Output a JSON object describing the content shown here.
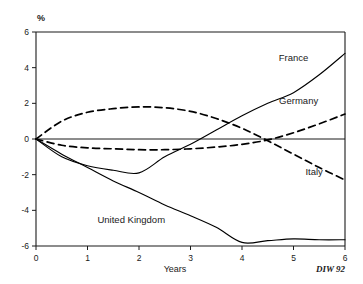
{
  "chart_data": {
    "type": "line",
    "title": "",
    "subtitle": "",
    "xlabel": "Years",
    "ylabel": "%",
    "unit_label": "%",
    "xlim": [
      0,
      6
    ],
    "ylim": [
      -6,
      6
    ],
    "grid": false,
    "legend_position": "inline-labels",
    "x_ticks": [
      "0",
      "1",
      "2",
      "3",
      "4",
      "5",
      "6"
    ],
    "y_ticks": [
      "6",
      "4",
      "2",
      "0",
      "-2",
      "-4",
      "-6"
    ],
    "x": [
      0,
      0.5,
      1,
      1.5,
      2,
      2.5,
      3,
      3.5,
      4,
      4.5,
      5,
      5.5,
      6
    ],
    "series": [
      {
        "name": "France",
        "style": "solid",
        "label": "France",
        "values": [
          0,
          -1.0,
          -1.5,
          -1.75,
          -1.9,
          -1.0,
          -0.3,
          0.5,
          1.3,
          2.0,
          2.6,
          3.6,
          4.8
        ]
      },
      {
        "name": "Germany",
        "style": "dashed",
        "label": "Germany",
        "values": [
          0,
          -0.35,
          -0.5,
          -0.55,
          -0.6,
          -0.6,
          -0.55,
          -0.45,
          -0.3,
          -0.05,
          0.35,
          0.85,
          1.4
        ]
      },
      {
        "name": "Italy",
        "style": "dashed",
        "label": "Italy",
        "values": [
          0,
          1.0,
          1.5,
          1.7,
          1.8,
          1.75,
          1.55,
          1.15,
          0.6,
          -0.1,
          -0.85,
          -1.6,
          -2.3
        ]
      },
      {
        "name": "United Kingdom",
        "style": "solid",
        "label": "United Kingdom",
        "values": [
          0,
          -0.85,
          -1.6,
          -2.35,
          -3.0,
          -3.7,
          -4.3,
          -4.95,
          -5.8,
          -5.7,
          -5.6,
          -5.65,
          -5.65
        ]
      }
    ],
    "annotations": [
      {
        "text": "France",
        "x": 5.0,
        "y": 4.35
      },
      {
        "text": "Germany",
        "x": 5.1,
        "y": 1.95
      },
      {
        "text": "Italy",
        "x": 5.4,
        "y": -2.0
      },
      {
        "text": "United Kingdom",
        "x": 1.85,
        "y": -4.7
      }
    ],
    "source": "DIW 92"
  }
}
